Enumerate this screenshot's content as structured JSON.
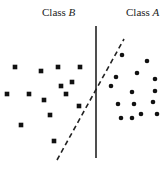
{
  "labels": {
    "class_b": {
      "prefix": "Class ",
      "letter": "B"
    },
    "class_a": {
      "prefix": "Class ",
      "letter": "A"
    }
  },
  "colors": {
    "marker": "#111111",
    "separator": "#222222",
    "background": "#ffffff"
  },
  "class_b_points": [
    [
      15,
      67
    ],
    [
      41,
      71
    ],
    [
      58,
      67
    ],
    [
      80,
      67
    ],
    [
      72,
      82
    ],
    [
      61,
      86
    ],
    [
      7,
      94
    ],
    [
      29,
      94
    ],
    [
      66,
      94
    ],
    [
      44,
      100
    ],
    [
      79,
      106
    ],
    [
      50,
      115
    ],
    [
      21,
      125
    ],
    [
      54,
      141
    ]
  ],
  "class_a_points": [
    [
      122,
      55
    ],
    [
      147,
      61
    ],
    [
      116,
      77
    ],
    [
      137,
      73
    ],
    [
      155,
      79
    ],
    [
      111,
      86
    ],
    [
      132,
      92
    ],
    [
      155,
      91
    ],
    [
      118,
      104
    ],
    [
      134,
      104
    ],
    [
      153,
      102
    ],
    [
      121,
      118
    ],
    [
      132,
      118
    ],
    [
      141,
      114
    ],
    [
      157,
      114
    ]
  ],
  "separators": {
    "solid": {
      "style": "solid",
      "label": "vertical boundary"
    },
    "dashed": {
      "style": "dashed",
      "label": "oblique boundary"
    }
  }
}
